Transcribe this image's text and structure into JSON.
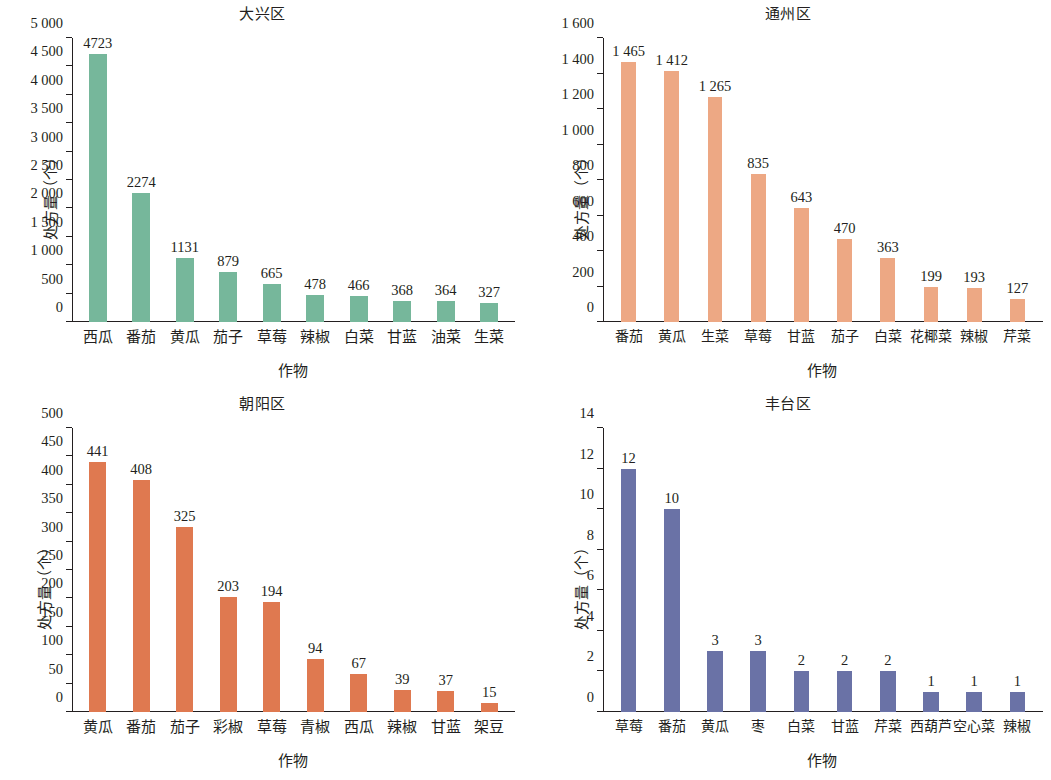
{
  "figure": {
    "panels": [
      "daxing",
      "tongzhou",
      "chaoyang",
      "fengtai"
    ]
  },
  "chart_data": [
    {
      "type": "bar",
      "title": "大兴区",
      "xlabel": "作物",
      "ylabel": "处方量（个）",
      "ylim": [
        0,
        5000
      ],
      "yticks": [
        "0",
        "500",
        "1 000",
        "1 500",
        "2 000",
        "2 500",
        "3 000",
        "3 500",
        "4 000",
        "4 500",
        "5 000"
      ],
      "ytick_values": [
        0,
        500,
        1000,
        1500,
        2000,
        2500,
        3000,
        3500,
        4000,
        4500,
        5000
      ],
      "grid": false,
      "legend": "none",
      "color": "#76b79b",
      "categories": [
        "西瓜",
        "番茄",
        "黄瓜",
        "茄子",
        "草莓",
        "辣椒",
        "白菜",
        "甘蓝",
        "油菜",
        "生菜"
      ],
      "values": [
        4723,
        2274,
        1131,
        879,
        665,
        478,
        466,
        368,
        364,
        327
      ],
      "labels": [
        "4723",
        "2274",
        "1131",
        "879",
        "665",
        "478",
        "466",
        "368",
        "364",
        "327"
      ]
    },
    {
      "type": "bar",
      "title": "通州区",
      "xlabel": "作物",
      "ylabel": "处方量（个）",
      "ylim": [
        0,
        1600
      ],
      "yticks": [
        "0",
        "200",
        "400",
        "600",
        "800",
        "1 000",
        "1 200",
        "1 400",
        "1 600"
      ],
      "ytick_values": [
        0,
        200,
        400,
        600,
        800,
        1000,
        1200,
        1400,
        1600
      ],
      "grid": false,
      "legend": "none",
      "color": "#eda884",
      "categories": [
        "番茄",
        "黄瓜",
        "生菜",
        "草莓",
        "甘蓝",
        "茄子",
        "白菜",
        "花椰菜",
        "辣椒",
        "芹菜"
      ],
      "values": [
        1465,
        1412,
        1265,
        835,
        643,
        470,
        363,
        199,
        193,
        127
      ],
      "labels": [
        "1 465",
        "1 412",
        "1 265",
        "835",
        "643",
        "470",
        "363",
        "199",
        "193",
        "127"
      ]
    },
    {
      "type": "bar",
      "title": "朝阳区",
      "xlabel": "作物",
      "ylabel": "处方量（个）",
      "ylim": [
        0,
        500
      ],
      "yticks": [
        "0",
        "50",
        "100",
        "150",
        "200",
        "250",
        "300",
        "350",
        "400",
        "450",
        "500"
      ],
      "ytick_values": [
        0,
        50,
        100,
        150,
        200,
        250,
        300,
        350,
        400,
        450,
        500
      ],
      "grid": false,
      "legend": "none",
      "color": "#df7950",
      "categories": [
        "黄瓜",
        "番茄",
        "茄子",
        "彩椒",
        "草莓",
        "青椒",
        "西瓜",
        "辣椒",
        "甘蓝",
        "架豆"
      ],
      "values": [
        441,
        408,
        325,
        203,
        194,
        94,
        67,
        39,
        37,
        15
      ],
      "labels": [
        "441",
        "408",
        "325",
        "203",
        "194",
        "94",
        "67",
        "39",
        "37",
        "15"
      ]
    },
    {
      "type": "bar",
      "title": "丰台区",
      "xlabel": "作物",
      "ylabel": "处方量（个）",
      "ylim": [
        0,
        14
      ],
      "yticks": [
        "0",
        "2",
        "4",
        "6",
        "8",
        "10",
        "12",
        "14"
      ],
      "ytick_values": [
        0,
        2,
        4,
        6,
        8,
        10,
        12,
        14
      ],
      "grid": false,
      "legend": "none",
      "color": "#6a72a6",
      "categories": [
        "草莓",
        "番茄",
        "黄瓜",
        "枣",
        "白菜",
        "甘蓝",
        "芹菜",
        "西葫芦",
        "空心菜",
        "辣椒"
      ],
      "values": [
        12,
        10,
        3,
        3,
        2,
        2,
        2,
        1,
        1,
        1
      ],
      "labels": [
        "12",
        "10",
        "3",
        "3",
        "2",
        "2",
        "2",
        "1",
        "1",
        "1"
      ]
    }
  ]
}
